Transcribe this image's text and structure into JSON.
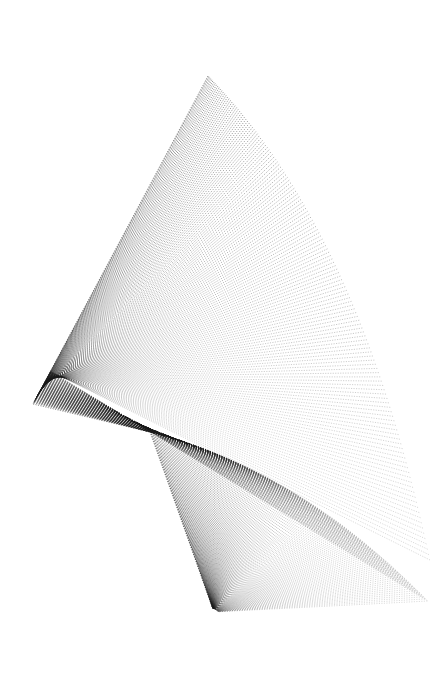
{
  "canvas": {
    "width": 444,
    "height": 689,
    "background": "#ffffff",
    "title": "Stippled Chevron Caustic"
  },
  "render": {
    "stroke_color": "#1a1a1a",
    "stroke_width": 0.55,
    "dash_pattern": "1.15 1.35",
    "line_count": 150,
    "opacity_near": 0.92,
    "opacity_far": 0.3
  },
  "geometry": {
    "cusp": {
      "x": 33,
      "y": 404
    },
    "apex": {
      "x": 208,
      "y": 76
    },
    "fan_origin": {
      "x": 214,
      "y": 612
    },
    "top_start": {
      "x": 208,
      "y": 76
    },
    "bottom_start": {
      "x": 214,
      "y": 612
    },
    "vertex_arc": {
      "start": {
        "x": 150,
        "y": 432
      },
      "end": {
        "x": 428,
        "y": 601
      },
      "control": {
        "x": 300,
        "y": 470
      }
    },
    "tail_arc": {
      "start": {
        "x": 208,
        "y": 76
      },
      "end": {
        "x": 430,
        "y": 560
      },
      "control": {
        "x": 360,
        "y": 230
      }
    },
    "return_target": {
      "x": 214,
      "y": 612
    }
  },
  "chart_data": {
    "type": "line",
    "xlabel": "",
    "ylabel": "",
    "xlim": [
      0,
      444
    ],
    "ylim": [
      0,
      689
    ],
    "grid": false,
    "legend": "none",
    "series": [
      {
        "name": "tail-arc-endpoints",
        "x": [
          208,
          236,
          263,
          288,
          311,
          333,
          353,
          372,
          389,
          404,
          415,
          424,
          430
        ],
        "y": [
          76,
          112,
          152,
          196,
          242,
          288,
          335,
          380,
          424,
          464,
          500,
          532,
          560
        ]
      },
      {
        "name": "vertex-arc-points",
        "x": [
          150,
          172,
          196,
          221,
          247,
          272,
          297,
          321,
          345,
          368,
          390,
          410,
          428
        ],
        "y": [
          432,
          444,
          457,
          470,
          483,
          496,
          509,
          522,
          535,
          549,
          563,
          581,
          601
        ]
      }
    ],
    "annotations": [
      {
        "label": "cusp",
        "x": 33,
        "y": 404
      },
      {
        "label": "apex",
        "x": 208,
        "y": 76
      },
      {
        "label": "fan-origin",
        "x": 214,
        "y": 612
      }
    ]
  }
}
